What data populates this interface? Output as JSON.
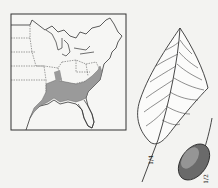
{
  "figure": {
    "map": {
      "description": "Range map of eastern United States with shaded southeastern distribution",
      "shade_color": "#9a9a9a",
      "line_color": "#333333"
    },
    "leaf": {
      "description": "Line drawing of a leaf with pinnate veins"
    },
    "fruit": {
      "description": "Stippled oval fruit/drupe with stem"
    },
    "scale_labels": {
      "leaf": "1/4",
      "fruit": "1/2"
    }
  }
}
